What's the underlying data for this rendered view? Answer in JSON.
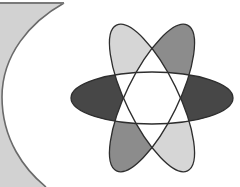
{
  "canvas": {
    "width": 240,
    "height": 187,
    "background": "#ffffff"
  },
  "crescent": {
    "fill": "#d2d2d2",
    "stroke": "#6a6a6a"
  },
  "atom": {
    "center": [
      152,
      98
    ],
    "rx": 81,
    "ry": 26,
    "stroke": "#2e2e2e",
    "ellipses": [
      {
        "name": "horizontal",
        "angle": 0
      },
      {
        "name": "tilt-left",
        "angle": 64
      },
      {
        "name": "tilt-right",
        "angle": -64
      }
    ],
    "petal_colors": {
      "upper_left": "#d6d6d6",
      "upper_right": "#8c8c8c",
      "left": "#474747",
      "right": "#474747",
      "lower_left": "#8c8c8c",
      "lower_right": "#d6d6d6",
      "center": "#ffffff"
    }
  }
}
